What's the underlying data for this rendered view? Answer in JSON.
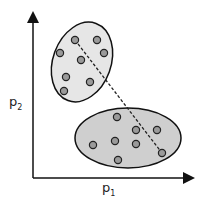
{
  "axes": {
    "x_label": "p",
    "x_sub": "1",
    "y_label": "p",
    "y_sub": "2"
  },
  "clusters": [
    {
      "name": "upper-cluster",
      "fill": "#e6e6e6",
      "ellipse": {
        "cx": 82,
        "cy": 62,
        "rx": 29,
        "ry": 41,
        "rotate": 20
      },
      "points": [
        [
          75,
          40
        ],
        [
          97,
          40
        ],
        [
          60,
          53
        ],
        [
          104,
          53
        ],
        [
          81,
          60
        ],
        [
          66,
          77
        ],
        [
          90,
          82
        ],
        [
          64,
          91
        ]
      ]
    },
    {
      "name": "lower-cluster",
      "fill": "#cfcfcf",
      "ellipse": {
        "cx": 128,
        "cy": 138,
        "rx": 53,
        "ry": 30,
        "rotate": 0
      },
      "points": [
        [
          117,
          117
        ],
        [
          136,
          130
        ],
        [
          157,
          130
        ],
        [
          115,
          141
        ],
        [
          136,
          144
        ],
        [
          93,
          145
        ],
        [
          162,
          153
        ],
        [
          118,
          160
        ]
      ]
    }
  ],
  "dashed_line": {
    "x1": 75,
    "y1": 40,
    "x2": 162,
    "y2": 153
  }
}
